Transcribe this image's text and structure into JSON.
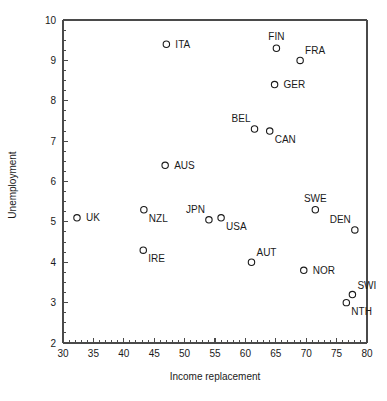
{
  "chart_data": {
    "type": "scatter",
    "title": "",
    "xlabel": "Income replacement",
    "ylabel": "Unemployment",
    "xlim": [
      30,
      80
    ],
    "ylim": [
      2,
      10
    ],
    "xticks": [
      30,
      35,
      40,
      45,
      50,
      55,
      60,
      65,
      70,
      75,
      80
    ],
    "yticks": [
      2,
      3,
      4,
      5,
      6,
      7,
      8,
      9,
      10
    ],
    "xtick_labels": [
      "30",
      "35",
      "40",
      "45",
      "50",
      "55",
      "60",
      "65",
      "70",
      "75",
      "80"
    ],
    "ytick_labels": [
      "2",
      "3",
      "4",
      "5",
      "6",
      "7",
      "8",
      "9",
      "10"
    ],
    "x_minor_step": 1,
    "y_minor_step": 0.25,
    "grid": false,
    "legend": false,
    "marker": "open-circle",
    "marker_color": "#1a1a1a",
    "points": [
      {
        "label": "UK",
        "x": 32.3,
        "y": 5.1,
        "label_pos": "right"
      },
      {
        "label": "IRE",
        "x": 43.2,
        "y": 4.3,
        "label_pos": "below-right"
      },
      {
        "label": "NZL",
        "x": 43.3,
        "y": 5.3,
        "label_pos": "below-right"
      },
      {
        "label": "AUS",
        "x": 46.8,
        "y": 6.4,
        "label_pos": "right"
      },
      {
        "label": "ITA",
        "x": 47.0,
        "y": 9.4,
        "label_pos": "right"
      },
      {
        "label": "JPN",
        "x": 54.0,
        "y": 5.05,
        "label_pos": "above-left"
      },
      {
        "label": "USA",
        "x": 56.0,
        "y": 5.1,
        "label_pos": "below-right"
      },
      {
        "label": "AUT",
        "x": 61.0,
        "y": 4.0,
        "label_pos": "above-right"
      },
      {
        "label": "BEL",
        "x": 61.5,
        "y": 7.3,
        "label_pos": "above-left"
      },
      {
        "label": "CAN",
        "x": 64.0,
        "y": 7.25,
        "label_pos": "below-right"
      },
      {
        "label": "GER",
        "x": 64.8,
        "y": 8.4,
        "label_pos": "right"
      },
      {
        "label": "FIN",
        "x": 65.1,
        "y": 9.3,
        "label_pos": "above"
      },
      {
        "label": "FRA",
        "x": 69.0,
        "y": 9.0,
        "label_pos": "above-right"
      },
      {
        "label": "NOR",
        "x": 69.6,
        "y": 3.8,
        "label_pos": "right"
      },
      {
        "label": "SWE",
        "x": 71.5,
        "y": 5.3,
        "label_pos": "above"
      },
      {
        "label": "NTH",
        "x": 76.6,
        "y": 3.0,
        "label_pos": "below-right"
      },
      {
        "label": "SWI",
        "x": 77.6,
        "y": 3.2,
        "label_pos": "above-right"
      },
      {
        "label": "DEN",
        "x": 78.0,
        "y": 4.8,
        "label_pos": "above-left"
      }
    ]
  },
  "plot_geometry": {
    "left": 63,
    "right": 367,
    "top": 20,
    "bottom": 343
  }
}
